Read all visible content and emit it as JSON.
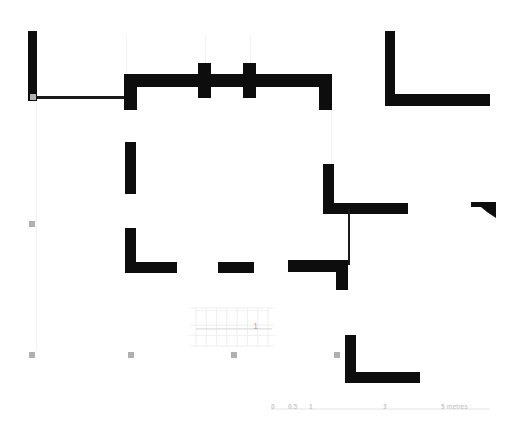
{
  "plan": {
    "title": "Archaeological building floor plan",
    "room_label": "1",
    "wall_color": "#0d0d0d",
    "thin_line_color": "#1a1a1a",
    "marker_color": "#b0b0b0",
    "guide_color": "#f2f2f2",
    "background_color": "#ffffff"
  },
  "scale_bar": {
    "text_color": "#bdbdbd",
    "line_color": "#e2e2e2",
    "ticks": [
      {
        "label": "0",
        "x": 273
      },
      {
        "label": "0.5",
        "x": 290
      },
      {
        "label": "1",
        "x": 311
      },
      {
        "label": "3",
        "x": 385
      },
      {
        "label": "5 metres",
        "x": 443
      }
    ]
  },
  "markers": [
    {
      "name": "marker-left-mid",
      "x": 32,
      "y": 224
    },
    {
      "name": "marker-left-bottom",
      "x": 32,
      "y": 355
    },
    {
      "name": "marker-center-bottom",
      "x": 131,
      "y": 355
    },
    {
      "name": "marker-right-bottom",
      "x": 234,
      "y": 355
    },
    {
      "name": "marker-far-right-bottom",
      "x": 337,
      "y": 355
    },
    {
      "name": "marker-wall-junction",
      "x": 33,
      "y": 97
    }
  ],
  "walls": [
    {
      "name": "wall-left-outer-vertical",
      "x": 28,
      "y": 31,
      "w": 9,
      "h": 70
    },
    {
      "name": "wall-left-horizontal-thin",
      "x": 33,
      "y": 96,
      "w": 93,
      "h": 3
    },
    {
      "name": "wall-north-main-horizontal",
      "x": 124,
      "y": 74,
      "w": 208,
      "h": 13
    },
    {
      "name": "wall-north-left-return",
      "x": 124,
      "y": 74,
      "w": 13,
      "h": 36
    },
    {
      "name": "wall-pier-left",
      "x": 198,
      "y": 63,
      "w": 13,
      "h": 35
    },
    {
      "name": "wall-pier-right",
      "x": 243,
      "y": 63,
      "w": 13,
      "h": 35
    },
    {
      "name": "wall-north-right-return",
      "x": 319,
      "y": 74,
      "w": 13,
      "h": 36
    },
    {
      "name": "wall-west-interior-upper",
      "x": 125,
      "y": 142,
      "w": 11,
      "h": 52
    },
    {
      "name": "wall-west-interior-lower",
      "x": 125,
      "y": 228,
      "w": 11,
      "h": 45
    },
    {
      "name": "wall-south-left-segment",
      "x": 125,
      "y": 262,
      "w": 52,
      "h": 11
    },
    {
      "name": "wall-south-mid-segment",
      "x": 218,
      "y": 262,
      "w": 36,
      "h": 11
    },
    {
      "name": "wall-south-right-segment",
      "x": 288,
      "y": 260,
      "w": 60,
      "h": 12
    },
    {
      "name": "wall-south-right-return",
      "x": 336,
      "y": 260,
      "w": 12,
      "h": 30
    },
    {
      "name": "wall-east-interior-vertical",
      "x": 323,
      "y": 164,
      "w": 11,
      "h": 50
    },
    {
      "name": "wall-east-interior-horizontal",
      "x": 323,
      "y": 203,
      "w": 85,
      "h": 11
    },
    {
      "name": "wall-east-interior-thin",
      "x": 348,
      "y": 209,
      "w": 2,
      "h": 56
    },
    {
      "name": "wall-northeast-vertical",
      "x": 385,
      "y": 31,
      "w": 10,
      "h": 70
    },
    {
      "name": "wall-northeast-horizontal",
      "x": 385,
      "y": 94,
      "w": 105,
      "h": 12
    },
    {
      "name": "wall-southeast-vertical",
      "x": 345,
      "y": 335,
      "w": 11,
      "h": 48
    },
    {
      "name": "wall-southeast-horizontal",
      "x": 345,
      "y": 372,
      "w": 75,
      "h": 11
    }
  ],
  "wedge": {
    "name": "wall-far-east-wedge",
    "points": "471,202 496,202 496,218 487,212 481,207 471,207"
  },
  "guides": [
    {
      "name": "guide-vertical-left",
      "x": 36,
      "y": 100,
      "w": 1,
      "h": 250
    },
    {
      "name": "guide-vertical-a",
      "x": 126,
      "y": 36,
      "w": 1,
      "h": 40
    },
    {
      "name": "guide-vertical-b",
      "x": 205,
      "y": 36,
      "w": 1,
      "h": 30
    },
    {
      "name": "guide-vertical-c",
      "x": 250,
      "y": 36,
      "w": 1,
      "h": 30
    },
    {
      "name": "guide-vertical-d",
      "x": 331,
      "y": 110,
      "w": 1,
      "h": 90
    },
    {
      "name": "guide-horizontal-stairs",
      "x": 195,
      "y": 310,
      "w": 75,
      "h": 1
    }
  ],
  "stairs": {
    "name": "stair-hatching",
    "x": 196,
    "y": 308,
    "width": 72,
    "height": 38,
    "tread_count": 7,
    "line_color": "#efefef"
  }
}
